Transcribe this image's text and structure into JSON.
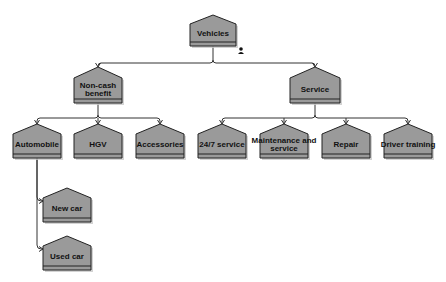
{
  "diagram": {
    "type": "hierarchy",
    "colors": {
      "node_fill": "#9a9a9a",
      "node_border": "#222222",
      "connector": "#333333",
      "background": "#ffffff"
    },
    "nodes": [
      {
        "id": "vehicles",
        "label": [
          "Vehicles"
        ],
        "parent": null,
        "has_user_icon": true
      },
      {
        "id": "non-cash-benefit",
        "label": [
          "Non-cash",
          "benefit"
        ],
        "parent": "vehicles"
      },
      {
        "id": "service",
        "label": [
          "Service"
        ],
        "parent": "vehicles"
      },
      {
        "id": "automobile",
        "label": [
          "Automobile"
        ],
        "parent": "non-cash-benefit"
      },
      {
        "id": "hgv",
        "label": [
          "HGV"
        ],
        "parent": "non-cash-benefit"
      },
      {
        "id": "accessories",
        "label": [
          "Accessories"
        ],
        "parent": "non-cash-benefit"
      },
      {
        "id": "247-service",
        "label": [
          "24/7 service"
        ],
        "parent": "service"
      },
      {
        "id": "maintenance-and-service",
        "label": [
          "Maintenance and",
          "service"
        ],
        "parent": "service"
      },
      {
        "id": "repair",
        "label": [
          "Repair"
        ],
        "parent": "service"
      },
      {
        "id": "driver-training",
        "label": [
          "Driver training"
        ],
        "parent": "service"
      },
      {
        "id": "new-car",
        "label": [
          "New car"
        ],
        "parent": "automobile"
      },
      {
        "id": "used-car",
        "label": [
          "Used car"
        ],
        "parent": "automobile"
      }
    ],
    "icons": {
      "vehicles_badge": "user-icon"
    }
  }
}
